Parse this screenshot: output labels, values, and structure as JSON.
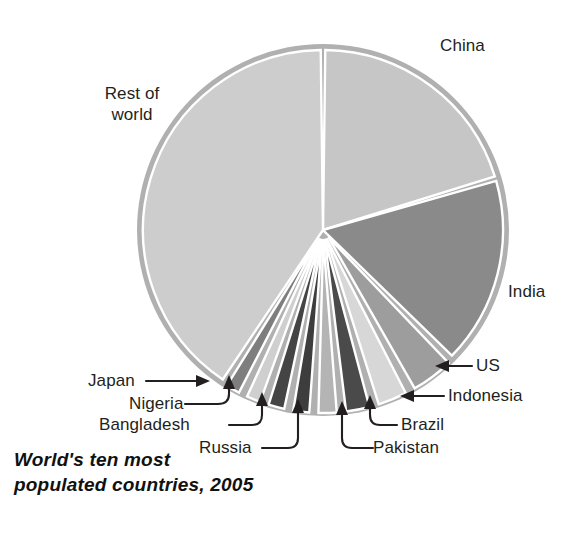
{
  "caption": {
    "line1": "World's ten most",
    "line2": "populated countries, 2005"
  },
  "labels": {
    "china": "China",
    "india": "India",
    "us": "US",
    "indonesia": "Indonesia",
    "brazil": "Brazil",
    "pakistan": "Pakistan",
    "russia": "Russia",
    "bangladesh": "Bangladesh",
    "nigeria": "Nigeria",
    "japan": "Japan",
    "rest_of_world_line1": "Rest of",
    "rest_of_world_line2": "world"
  },
  "colors": {
    "china": "#c6c6c6",
    "india": "#8a8a8a",
    "us": "#9d9d9d",
    "indonesia": "#d7d7d7",
    "brazil": "#4a4a4a",
    "pakistan": "#b4b4b4",
    "russia": "#3d3d3d",
    "bangladesh": "#444444",
    "nigeria": "#cfcfcf",
    "japan": "#7e7e7e",
    "rest_of_world": "#cdcdcd",
    "rim": "#b0b0b0",
    "separator": "#ffffff",
    "leader": "#231f20",
    "text": "#231f20",
    "background": "#ffffff"
  },
  "chart_data": {
    "type": "pie",
    "title": "World's ten most populated countries, 2005",
    "unit": "percent of world population",
    "legend": "labels placed around slices with leader lines",
    "grid": false,
    "center": {
      "x": 323,
      "y": 230
    },
    "radius": 186,
    "start_angle_deg": -90,
    "direction": "clockwise",
    "exploded_slices": [
      "US",
      "Indonesia",
      "Brazil",
      "Pakistan",
      "Russia",
      "Bangladesh",
      "Nigeria",
      "Japan"
    ],
    "categories": [
      "China",
      "India",
      "US",
      "Indonesia",
      "Brazil",
      "Pakistan",
      "Russia",
      "Bangladesh",
      "Nigeria",
      "Japan",
      "Rest of world"
    ],
    "values": [
      20.4,
      17.1,
      4.6,
      3.4,
      2.9,
      2.4,
      2.2,
      2.2,
      2.0,
      2.0,
      40.8
    ],
    "slices": [
      {
        "label": "China",
        "value": 20.4,
        "color": "#c6c6c6",
        "exploded": false
      },
      {
        "label": "India",
        "value": 17.1,
        "color": "#8a8a8a",
        "exploded": false
      },
      {
        "label": "US",
        "value": 4.6,
        "color": "#9d9d9d",
        "exploded": true
      },
      {
        "label": "Indonesia",
        "value": 3.4,
        "color": "#d7d7d7",
        "exploded": true
      },
      {
        "label": "Brazil",
        "value": 2.9,
        "color": "#4a4a4a",
        "exploded": true
      },
      {
        "label": "Pakistan",
        "value": 2.4,
        "color": "#b4b4b4",
        "exploded": true
      },
      {
        "label": "Russia",
        "value": 2.2,
        "color": "#3d3d3d",
        "exploded": true
      },
      {
        "label": "Bangladesh",
        "value": 2.2,
        "color": "#444444",
        "exploded": true
      },
      {
        "label": "Nigeria",
        "value": 2.0,
        "color": "#cfcfcf",
        "exploded": true
      },
      {
        "label": "Japan",
        "value": 2.0,
        "color": "#7e7e7e",
        "exploded": true
      },
      {
        "label": "Rest of world",
        "value": 40.8,
        "color": "#cdcdcd",
        "exploded": false
      }
    ]
  }
}
